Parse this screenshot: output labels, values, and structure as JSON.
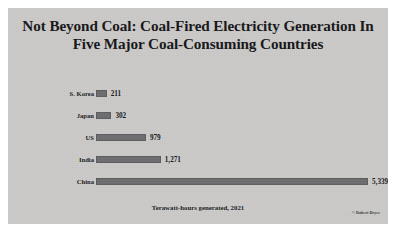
{
  "figure": {
    "panel_color": "#cccbc9",
    "bar_color": "#6e6e70",
    "text_color": "#17171a"
  },
  "caption": "Terawatt-hours generated, 2021",
  "credit": "© Robert Bryce",
  "source_mark": "",
  "chart_data": {
    "type": "bar",
    "orientation": "horizontal",
    "title": "Not Beyond Coal: Coal-Fired Electricity Generation In Five Major Coal-Consuming Countries",
    "xlabel": "",
    "ylabel": "",
    "unit": "Terawatt-hours",
    "year": 2021,
    "grid": false,
    "legend": false,
    "axis_visible": false,
    "xlim": [
      0,
      5339
    ],
    "categories": [
      "S. Korea",
      "Japan",
      "US",
      "India",
      "China"
    ],
    "values": [
      211,
      302,
      979,
      1271,
      5339
    ],
    "value_labels": [
      "211",
      "302",
      "979",
      "1,271",
      "5,339"
    ]
  }
}
